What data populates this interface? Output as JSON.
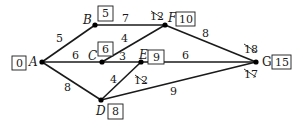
{
  "diagram": {
    "type": "weighted-network-shortest-path",
    "nodes": [
      {
        "id": "A",
        "label": "A",
        "x": 42,
        "y": 62,
        "value": "0"
      },
      {
        "id": "B",
        "label": "B",
        "x": 95,
        "y": 25,
        "value": "5"
      },
      {
        "id": "C",
        "label": "C",
        "x": 102,
        "y": 62,
        "value": "6"
      },
      {
        "id": "E",
        "label": "E",
        "x": 141,
        "y": 62,
        "value": "9"
      },
      {
        "id": "F",
        "label": "F",
        "x": 165,
        "y": 25,
        "value": "10"
      },
      {
        "id": "D",
        "label": "D",
        "x": 101,
        "y": 100,
        "value": "8"
      },
      {
        "id": "G",
        "label": "G",
        "x": 256,
        "y": 62,
        "value": "15"
      }
    ],
    "edges": [
      {
        "from": "A",
        "to": "B",
        "weight": "5"
      },
      {
        "from": "A",
        "to": "C",
        "weight": "6"
      },
      {
        "from": "A",
        "to": "D",
        "weight": "8"
      },
      {
        "from": "B",
        "to": "F",
        "weight": "7"
      },
      {
        "from": "C",
        "to": "F",
        "weight": "4"
      },
      {
        "from": "C",
        "to": "E",
        "weight": "3"
      },
      {
        "from": "D",
        "to": "E",
        "weight": "4"
      },
      {
        "from": "E",
        "to": "G",
        "weight": "6"
      },
      {
        "from": "F",
        "to": "G",
        "weight": "8"
      },
      {
        "from": "D",
        "to": "G",
        "weight": "9"
      }
    ],
    "crossed_out_values": [
      {
        "near": "F",
        "value": "12"
      },
      {
        "near": "E",
        "value": "12"
      },
      {
        "near": "G",
        "value": "18",
        "position": "above"
      },
      {
        "near": "G",
        "value": "17",
        "position": "below"
      }
    ]
  }
}
